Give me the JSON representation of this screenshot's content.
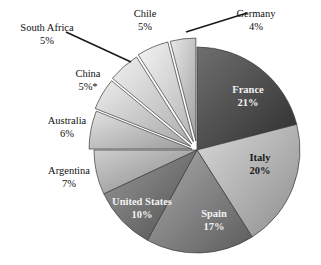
{
  "chart_data": {
    "type": "pie",
    "title": "",
    "subtitle": "",
    "xlabel": "",
    "ylabel": "",
    "legend_position": "none",
    "grid": false,
    "units": "percent",
    "note": "China value carries an asterisk footnote marker",
    "categories": [
      "France",
      "Italy",
      "Spain",
      "United States",
      "Argentina",
      "Australia",
      "China",
      "South Africa",
      "Chile",
      "Germany"
    ],
    "values": [
      21,
      20,
      17,
      10,
      7,
      6,
      5,
      5,
      5,
      4
    ],
    "slices": [
      {
        "name": "France",
        "label": "France",
        "value": 21,
        "value_text": "21%",
        "start_angle": 0,
        "end_angle": 75.6,
        "explode": 0,
        "fill": "#4a4a4a",
        "grad_from": "#6f6f6f",
        "grad_to": "#2e2e2e",
        "label_placement": "inside",
        "label_tone": "dark",
        "label_left": 248,
        "label_top": 84
      },
      {
        "name": "Italy",
        "label": "Italy",
        "value": 20,
        "value_text": "20%",
        "start_angle": 75.6,
        "end_angle": 147.6,
        "explode": 0,
        "fill": "#b8b8b8",
        "grad_from": "#d8d8d8",
        "grad_to": "#8e8e8e",
        "label_placement": "inside",
        "label_tone": "light",
        "label_left": 260,
        "label_top": 152
      },
      {
        "name": "Spain",
        "label": "Spain",
        "value": 17,
        "value_text": "17%",
        "start_angle": 147.6,
        "end_angle": 208.8,
        "explode": 0,
        "fill": "#8d8d8d",
        "grad_from": "#ababab",
        "grad_to": "#5c5c5c",
        "label_placement": "inside",
        "label_tone": "dark",
        "label_left": 214,
        "label_top": 208
      },
      {
        "name": "United States",
        "label": "United States",
        "value": 10,
        "value_text": "10%",
        "start_angle": 208.8,
        "end_angle": 244.8,
        "explode": 0,
        "fill": "#747474",
        "grad_from": "#9a9a9a",
        "grad_to": "#4f4f4f",
        "label_placement": "inside",
        "label_tone": "dark",
        "label_left": 142,
        "label_top": 196
      },
      {
        "name": "Argentina",
        "label": "Argentina",
        "value": 7,
        "value_text": "7%",
        "start_angle": 244.8,
        "end_angle": 270.0,
        "explode": 0,
        "fill": "#b0b0b0",
        "grad_from": "#cfcfcf",
        "grad_to": "#868686",
        "label_placement": "outside",
        "label_left": 69,
        "label_top": 165
      },
      {
        "name": "Australia",
        "label": "Australia",
        "value": 6,
        "value_text": "6%",
        "start_angle": 270.0,
        "end_angle": 291.6,
        "explode": 5,
        "fill": "#c2c2c2",
        "grad_from": "#e2e2e2",
        "grad_to": "#9b9b9b",
        "label_placement": "outside",
        "label_left": 67,
        "label_top": 115
      },
      {
        "name": "China",
        "label": "China",
        "value": 5,
        "value_text": "5%*",
        "start_angle": 291.6,
        "end_angle": 309.6,
        "explode": 7,
        "fill": "#cfcfcf",
        "grad_from": "#ececec",
        "grad_to": "#a6a6a6",
        "label_placement": "outside",
        "label_left": 88,
        "label_top": 68
      },
      {
        "name": "South Africa",
        "label": "South Africa",
        "value": 5,
        "value_text": "5%",
        "start_angle": 309.6,
        "end_angle": 327.6,
        "explode": 8,
        "fill": "#d6d6d6",
        "grad_from": "#f0f0f0",
        "grad_to": "#adadad",
        "label_placement": "outside-leader",
        "label_left": 47,
        "label_top": 22
      },
      {
        "name": "Chile",
        "label": "Chile",
        "value": 5,
        "value_text": "5%",
        "start_angle": 327.6,
        "end_angle": 345.6,
        "explode": 9,
        "fill": "#dcdcdc",
        "grad_from": "#f4f4f4",
        "grad_to": "#b4b4b4",
        "label_placement": "outside",
        "label_left": 145,
        "label_top": 8
      },
      {
        "name": "Germany",
        "label": "Germany",
        "value": 4,
        "value_text": "4%",
        "start_angle": 345.6,
        "end_angle": 360.0,
        "explode": 9,
        "fill": "#c9c9c9",
        "grad_from": "#e8e8e8",
        "grad_to": "#a0a0a0",
        "label_placement": "outside-leader",
        "label_left": 256,
        "label_top": 8
      }
    ],
    "leader_lines": [
      {
        "name": "south-africa-leader",
        "x1": 66,
        "y1": 32,
        "x2": 131,
        "y2": 62
      },
      {
        "name": "germany-leader",
        "x1": 186,
        "y1": 32,
        "x2": 247,
        "y2": 13
      }
    ],
    "geometry": {
      "center_x": 197,
      "center_y": 150,
      "radius": 103
    },
    "colors": {
      "background": "#ffffff",
      "outline": "#3a3a3a",
      "leader_line": "#1a1a1a",
      "label_text": "#111111"
    }
  }
}
